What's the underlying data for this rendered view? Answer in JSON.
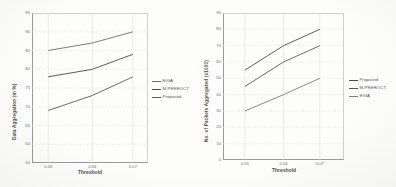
{
  "figure": {
    "background": "#fbfbf9",
    "grid_color": "#ddddd8",
    "axis_color": "#9a9a96"
  },
  "chart_data": [
    {
      "type": "line",
      "title": "",
      "xlabel": "Threshold",
      "ylabel": "Data Aggregation (in %)",
      "x": [
        0.05,
        0.06,
        0.07
      ],
      "xtick_labels": [
        "0.05",
        "0.06",
        "0.07"
      ],
      "xtick_frac": [
        0.14,
        0.52,
        0.87
      ],
      "ylim": [
        55,
        95
      ],
      "yticks": [
        55,
        60,
        65,
        70,
        75,
        80,
        85,
        90,
        95
      ],
      "grid": true,
      "legend_position": "right-outside",
      "series": [
        {
          "name": "EIGA",
          "values": [
            85,
            87,
            90
          ],
          "color": "#6e6e6a"
        },
        {
          "name": "M-PEEROCT",
          "values": [
            78,
            80,
            84
          ],
          "color": "#4a4a46"
        },
        {
          "name": "Proposed",
          "values": [
            69,
            73,
            78
          ],
          "color": "#5c5c58"
        }
      ]
    },
    {
      "type": "line",
      "title": "",
      "xlabel": "Threshold",
      "ylabel": "No. of Packets Aggregated (x1000)",
      "x": [
        0.05,
        0.06,
        0.07
      ],
      "xtick_labels": [
        "0.05",
        "0.06",
        "0.07"
      ],
      "xtick_frac": [
        0.18,
        0.5,
        0.8
      ],
      "ylim": [
        0,
        90
      ],
      "yticks": [
        0,
        10,
        20,
        30,
        40,
        50,
        60,
        70,
        80,
        90
      ],
      "grid": true,
      "legend_position": "right-outside",
      "series": [
        {
          "name": "Proposed",
          "values": [
            55,
            70,
            80
          ],
          "color": "#4a4a46"
        },
        {
          "name": "M-PEEROCT",
          "values": [
            45,
            60,
            70
          ],
          "color": "#595955"
        },
        {
          "name": "EIGA",
          "values": [
            30,
            40,
            50
          ],
          "color": "#7b7b77"
        }
      ]
    }
  ]
}
